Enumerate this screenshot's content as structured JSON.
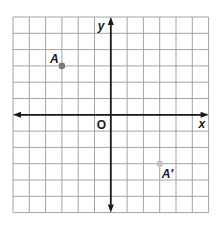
{
  "grid": {
    "left": 13,
    "top": 17,
    "cell": 16.3,
    "cols": 12,
    "rows": 12,
    "origin_col": 6,
    "origin_row": 6,
    "line_color": "#9a9a9a",
    "axis_color": "#1a1a1a"
  },
  "axes": {
    "x_label": "x",
    "y_label": "y",
    "origin_label": "O"
  },
  "points": [
    {
      "label": "A",
      "x": -3,
      "y": 3,
      "color": "#7a7a7a"
    },
    {
      "label": "A′",
      "x": 3,
      "y": -3,
      "color": "#c4c4c4"
    }
  ]
}
